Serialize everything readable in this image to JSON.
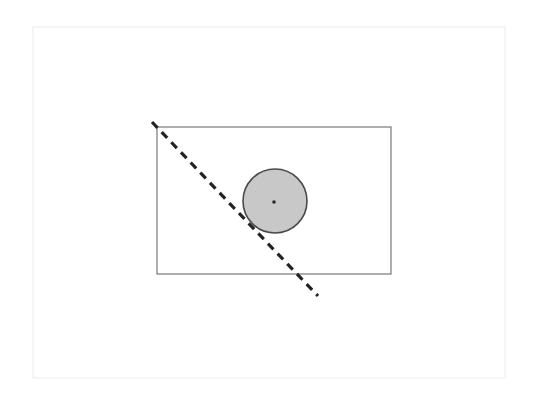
{
  "canvas": {
    "width": 536,
    "height": 397,
    "background": "#ffffff"
  },
  "colors": {
    "page_background": "#ffffff",
    "frame_stroke": "#f1f1f1",
    "rect_stroke": "#787878",
    "circle_fill": "#c8c8c8",
    "circle_stroke": "#4a4a4a",
    "center_dot": "#2b2b2b",
    "dashed_line": "#232323"
  },
  "shapes": {
    "page_frame": {
      "label": "page-frame",
      "x": 33,
      "y": 27,
      "width": 472,
      "height": 351,
      "stroke_width": 1.4
    },
    "rectangle": {
      "label": "rectangle",
      "x": 157,
      "y": 127,
      "width": 234,
      "height": 147,
      "stroke_width": 1.2
    },
    "circle": {
      "label": "circle",
      "cx": 275,
      "cy": 201,
      "r": 32,
      "stroke_width": 1.6
    },
    "center_dot": {
      "label": "circle-center-dot",
      "cx": 274,
      "cy": 202,
      "r": 1.8
    },
    "dashed_line": {
      "label": "dashed-secant-line",
      "x1": 152,
      "y1": 122,
      "x2": 318,
      "y2": 296,
      "stroke_width": 3.2,
      "dash_length": 8,
      "gap_length": 6
    }
  }
}
